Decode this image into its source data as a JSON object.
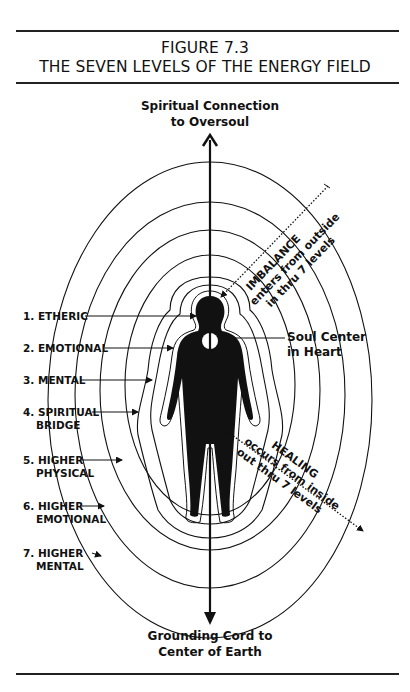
{
  "figure": {
    "number": "FIGURE 7.3",
    "title": "THE SEVEN LEVELS OF THE ENERGY FIELD"
  },
  "axis": {
    "top_label_line1": "Spiritual Connection",
    "top_label_line2": "to Oversoul",
    "bottom_label_line1": "Grounding Cord to",
    "bottom_label_line2": "Center of Earth"
  },
  "levels": [
    {
      "line1": "1. ETHERIC",
      "line2": ""
    },
    {
      "line1": "2. EMOTIONAL",
      "line2": ""
    },
    {
      "line1": "3. MENTAL",
      "line2": ""
    },
    {
      "line1": "4. SPIRITUAL",
      "line2": "BRIDGE"
    },
    {
      "line1": "5. HIGHER",
      "line2": "PHYSICAL"
    },
    {
      "line1": "6. HIGHER",
      "line2": "EMOTIONAL"
    },
    {
      "line1": "7. HIGHER",
      "line2": "MENTAL"
    }
  ],
  "soul_center": {
    "line1": "Soul Center",
    "line2": "in Heart"
  },
  "imbalance": {
    "line1": "IMBALANCE",
    "line2": "enters from outside",
    "line3": "in thru 7 levels"
  },
  "healing": {
    "line1": "HEALING",
    "line2": "occurs from inside",
    "line3": "out thru 7 levels"
  }
}
